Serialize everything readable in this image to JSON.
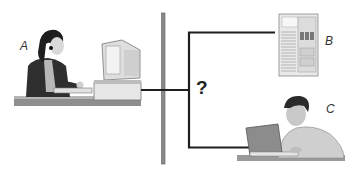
{
  "diagram": {
    "nodes": [
      {
        "id": "A",
        "label": "A",
        "description": "woman with headset at desktop computer"
      },
      {
        "id": "B",
        "label": "B",
        "description": "server rack cabinet"
      },
      {
        "id": "C",
        "label": "C",
        "description": "man working on laptop"
      }
    ],
    "connector_symbol": "?",
    "colors": {
      "backbone": "#8a8a8a",
      "wire": "#1e1e1e"
    }
  }
}
